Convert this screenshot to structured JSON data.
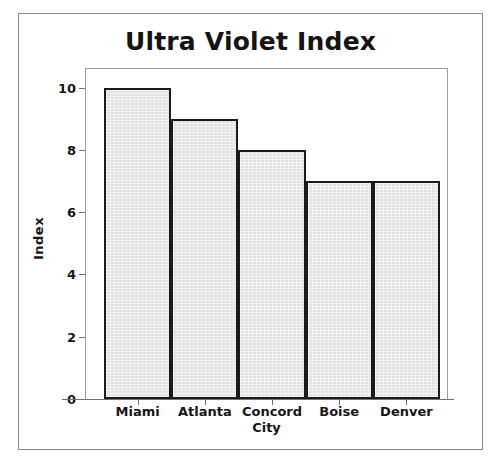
{
  "chart_data": {
    "type": "bar",
    "title": "Ultra Violet Index",
    "xlabel": "City",
    "ylabel": "Index",
    "categories": [
      "Miami",
      "Atlanta",
      "Concord",
      "Boise",
      "Denver"
    ],
    "values": [
      10,
      9,
      8,
      7,
      7
    ],
    "ylim": [
      0,
      10.6
    ],
    "yticks": [
      0,
      2,
      4,
      6,
      8,
      10
    ],
    "ytick_labels": [
      "0",
      "2",
      "4",
      "6",
      "8",
      "10"
    ],
    "grid": false,
    "legend": null,
    "series": [
      {
        "name": "Ultra Violet Index",
        "values": [
          10,
          9,
          8,
          7,
          7
        ]
      }
    ],
    "colors": {
      "bar_fill": "#e2e2e2",
      "bar_edge": "#1b1b1b",
      "axis": "#6e7072",
      "text": "#161616",
      "background": "#ffffff",
      "outer_border": "#888a8c"
    }
  }
}
